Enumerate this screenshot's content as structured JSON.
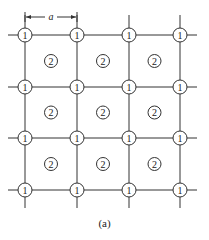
{
  "diagram": {
    "dimension_label": "a",
    "caption": "(a)",
    "grid": {
      "columns_x": [
        25,
        77,
        129,
        180
      ],
      "rows_y": [
        35,
        87,
        138,
        190
      ],
      "line_color": "#333333"
    },
    "corner_node_label": "1",
    "center_node_label": "2",
    "corner_nodes": [
      {
        "row": 0,
        "col": 0,
        "label": "1"
      },
      {
        "row": 0,
        "col": 1,
        "label": "1"
      },
      {
        "row": 0,
        "col": 2,
        "label": "1"
      },
      {
        "row": 0,
        "col": 3,
        "label": "1"
      },
      {
        "row": 1,
        "col": 0,
        "label": "1"
      },
      {
        "row": 1,
        "col": 1,
        "label": "1"
      },
      {
        "row": 1,
        "col": 2,
        "label": "1"
      },
      {
        "row": 1,
        "col": 3,
        "label": "1"
      },
      {
        "row": 2,
        "col": 0,
        "label": "1"
      },
      {
        "row": 2,
        "col": 1,
        "label": "1"
      },
      {
        "row": 2,
        "col": 2,
        "label": "1"
      },
      {
        "row": 2,
        "col": 3,
        "label": "1"
      },
      {
        "row": 3,
        "col": 0,
        "label": "1"
      },
      {
        "row": 3,
        "col": 1,
        "label": "1"
      },
      {
        "row": 3,
        "col": 2,
        "label": "1"
      },
      {
        "row": 3,
        "col": 3,
        "label": "1"
      }
    ],
    "center_nodes": [
      {
        "row": 0,
        "col": 0,
        "label": "2"
      },
      {
        "row": 0,
        "col": 1,
        "label": "2"
      },
      {
        "row": 0,
        "col": 2,
        "label": "2"
      },
      {
        "row": 1,
        "col": 0,
        "label": "2"
      },
      {
        "row": 1,
        "col": 1,
        "label": "2"
      },
      {
        "row": 1,
        "col": 2,
        "label": "2"
      },
      {
        "row": 2,
        "col": 0,
        "label": "2"
      },
      {
        "row": 2,
        "col": 1,
        "label": "2"
      },
      {
        "row": 2,
        "col": 2,
        "label": "2"
      }
    ]
  }
}
